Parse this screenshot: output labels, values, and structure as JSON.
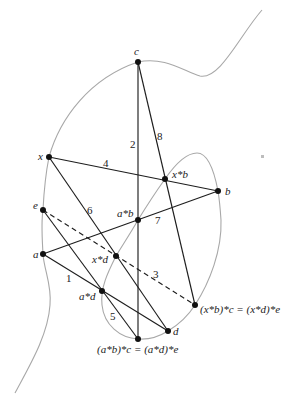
{
  "diagram": {
    "colors": {
      "curve": "#a8a8a8",
      "line": "#1e1e1e",
      "point": "#111111",
      "text": "#222222"
    },
    "points": [
      {
        "id": "c",
        "label": "c",
        "x": 138,
        "y": 62,
        "lx": 134,
        "ly": 55
      },
      {
        "id": "x",
        "label": "x",
        "x": 49,
        "y": 157,
        "lx": 38,
        "ly": 160
      },
      {
        "id": "xb",
        "label": "x*b",
        "x": 165,
        "y": 179,
        "lx": 172,
        "ly": 178
      },
      {
        "id": "b",
        "label": "b",
        "x": 218,
        "y": 191,
        "lx": 225,
        "ly": 195
      },
      {
        "id": "e",
        "label": "e",
        "x": 43,
        "y": 210,
        "lx": 33,
        "ly": 209
      },
      {
        "id": "ab",
        "label": "a*b",
        "x": 138,
        "y": 220,
        "lx": 117,
        "ly": 217
      },
      {
        "id": "a",
        "label": "a",
        "x": 43,
        "y": 254,
        "lx": 33,
        "ly": 258
      },
      {
        "id": "xd",
        "label": "x*d",
        "x": 116,
        "y": 256,
        "lx": 92,
        "ly": 263
      },
      {
        "id": "ad",
        "label": "a*d",
        "x": 102,
        "y": 291,
        "lx": 79,
        "ly": 300
      },
      {
        "id": "xbc",
        "label": "(x*b)*c = (x*d)*e",
        "x": 195,
        "y": 305,
        "lx": 200,
        "ly": 313
      },
      {
        "id": "d",
        "label": "d",
        "x": 168,
        "y": 331,
        "lx": 173,
        "ly": 335
      },
      {
        "id": "abc",
        "label": "(a*b)*c = (a*d)*e",
        "x": 138,
        "y": 339,
        "lx": 97,
        "ly": 353
      }
    ],
    "lines": [
      {
        "id": "1",
        "label": "1",
        "from": "a",
        "to": "d",
        "dashed": false,
        "lx": 66,
        "ly": 282
      },
      {
        "id": "2",
        "label": "2",
        "from": "c",
        "to": "abc",
        "dashed": false,
        "lx": 130,
        "ly": 148
      },
      {
        "id": "3",
        "label": "3",
        "from": "e",
        "to": "xbc",
        "dashed": true,
        "lx": 153,
        "ly": 278
      },
      {
        "id": "4",
        "label": "4",
        "from": "x",
        "to": "b",
        "dashed": false,
        "lx": 103,
        "ly": 167
      },
      {
        "id": "5",
        "label": "5",
        "from": "e",
        "to": "abc",
        "dashed": false,
        "lx": 110,
        "ly": 320
      },
      {
        "id": "6",
        "label": "6",
        "from": "x",
        "to": "d",
        "dashed": false,
        "lx": 87,
        "ly": 214
      },
      {
        "id": "7",
        "label": "7",
        "from": "a",
        "to": "b",
        "dashed": false,
        "lx": 155,
        "ly": 224
      },
      {
        "id": "8",
        "label": "8",
        "from": "c",
        "to": "xbc",
        "dashed": false,
        "lx": 157,
        "ly": 140
      }
    ],
    "marker": {
      "x": 261,
      "y": 155,
      "size": 3
    }
  }
}
